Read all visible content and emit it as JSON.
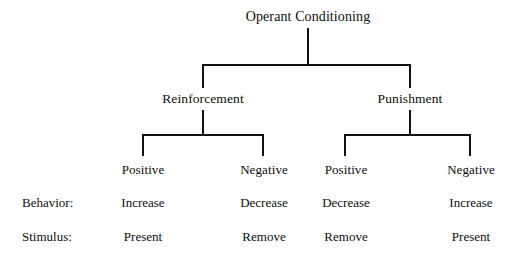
{
  "diagram": {
    "title": "Operant Conditioning",
    "branches": [
      {
        "label": "Reinforcement",
        "leaves": [
          {
            "label": "Positive",
            "behavior": "Increase",
            "stimulus": "Present"
          },
          {
            "label": "Negative",
            "behavior": "Decrease",
            "stimulus": "Remove"
          }
        ]
      },
      {
        "label": "Punishment",
        "leaves": [
          {
            "label": "Positive",
            "behavior": "Decrease",
            "stimulus": "Remove"
          },
          {
            "label": "Negative",
            "behavior": "Increase",
            "stimulus": "Present"
          }
        ]
      }
    ],
    "row_labels": {
      "behavior": "Behavior:",
      "stimulus": "Stimulus:"
    },
    "colors": {
      "background": "#ffffff",
      "text": "#0d0d0d",
      "connector": "#111111"
    }
  }
}
